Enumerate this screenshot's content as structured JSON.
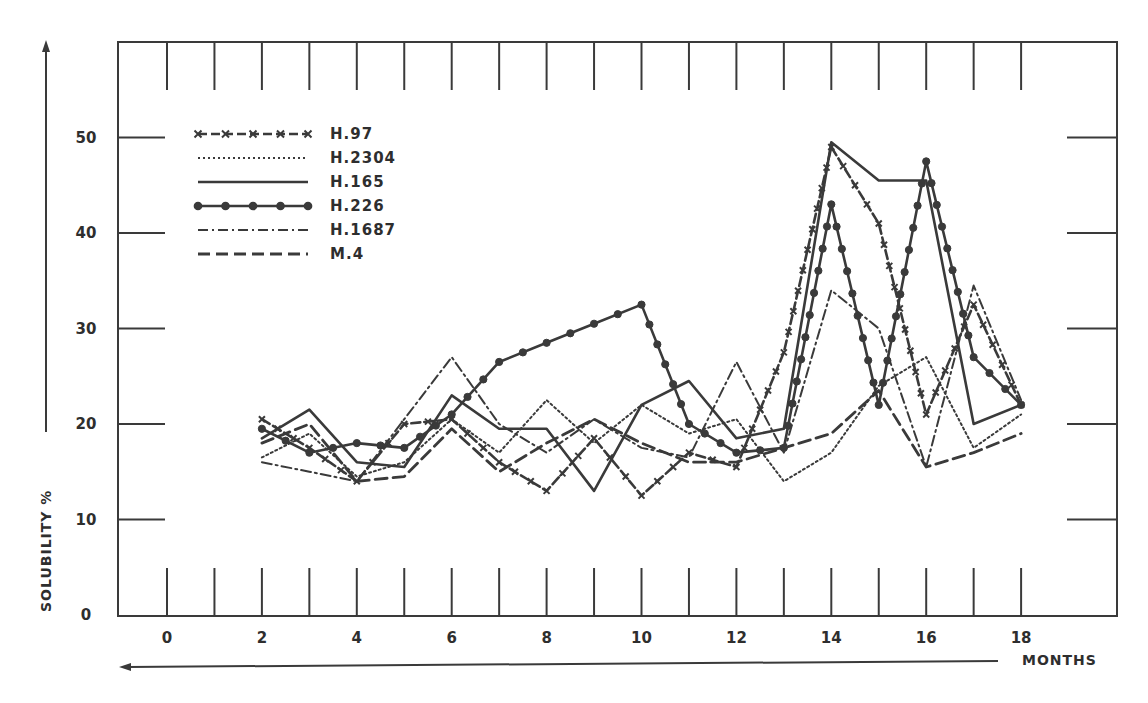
{
  "chart_data": {
    "type": "line",
    "title": "",
    "xlabel": "MONTHS",
    "ylabel": "SOLUBILITY %",
    "xlim": [
      0,
      18
    ],
    "ylim": [
      0,
      50
    ],
    "x_tick_labels": [
      "0",
      "2",
      "4",
      "6",
      "8",
      "10",
      "12",
      "14",
      "16",
      "18"
    ],
    "y_tick_labels": [
      "0",
      "10",
      "20",
      "30",
      "40",
      "50"
    ],
    "grid": false,
    "legend_position": "upper-left",
    "x": [
      2,
      3,
      4,
      5,
      6,
      7,
      8,
      9,
      10,
      11,
      12,
      13,
      14,
      15,
      16,
      17,
      18
    ],
    "series": [
      {
        "name": "H.97",
        "style": "dash-x-markers",
        "values": [
          20.5,
          17.5,
          14,
          20,
          20.5,
          16,
          13,
          18.5,
          12.5,
          17,
          15.5,
          27.5,
          49,
          41,
          21,
          32.5,
          22
        ]
      },
      {
        "name": "H.2304",
        "style": "dotted",
        "values": [
          16.5,
          19,
          14.5,
          16,
          20.5,
          17,
          22.5,
          18,
          22,
          19,
          20.5,
          14,
          17,
          24,
          27,
          17.5,
          21
        ]
      },
      {
        "name": "H.165",
        "style": "solid",
        "values": [
          18.5,
          21.5,
          16,
          15.5,
          23,
          19.5,
          19.5,
          13,
          22,
          24.5,
          18.5,
          19.5,
          49.5,
          45.5,
          45.5,
          20,
          22
        ]
      },
      {
        "name": "H.226",
        "style": "solid-circle-markers",
        "values": [
          19.5,
          17,
          18,
          17.5,
          21,
          26.5,
          28.5,
          30.5,
          32.5,
          20,
          17,
          17.5,
          43,
          22,
          47.5,
          27,
          22
        ]
      },
      {
        "name": "H.1687",
        "style": "dash-dot",
        "values": [
          16,
          15,
          14,
          20.5,
          27,
          20,
          17,
          20.5,
          17.5,
          16.5,
          26.5,
          17,
          34,
          30,
          15.5,
          34.5,
          22.5
        ]
      },
      {
        "name": "M.4",
        "style": "dashed",
        "values": [
          18,
          20,
          14,
          14.5,
          19.5,
          15,
          18,
          20.5,
          18,
          16,
          16,
          17.5,
          19,
          23.5,
          15.5,
          17,
          19
        ]
      }
    ]
  },
  "colors": {
    "ink": "#3a3a3a",
    "background": "#ffffff"
  }
}
